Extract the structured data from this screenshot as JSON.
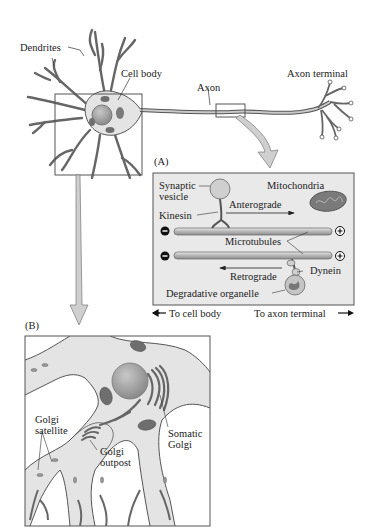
{
  "overview": {
    "labels": {
      "dendrites": "Dendrites",
      "cell_body": "Cell body",
      "axon": "Axon",
      "axon_terminal": "Axon terminal"
    }
  },
  "panel_a": {
    "letter": "(A)",
    "labels": {
      "synaptic_vesicle_line1": "Synaptic",
      "synaptic_vesicle_line2": "vesicle",
      "mitochondria": "Mitochondria",
      "kinesin": "Kinesin",
      "anterograde": "Anterograde",
      "microtubules": "Microtubules",
      "dynein": "Dynein",
      "retrograde": "Retrograde",
      "degradative_organelle": "Degradative organelle",
      "minus_symbol": "−",
      "plus_symbol": "+"
    },
    "direction": {
      "to_cell_body": "To cell body",
      "to_axon_terminal": "To axon terminal"
    }
  },
  "panel_b": {
    "letter": "(B)",
    "labels": {
      "golgi_satellite_line1": "Golgi",
      "golgi_satellite_line2": "satellite",
      "golgi_outpost_line1": "Golgi",
      "golgi_outpost_line2": "outpost",
      "somatic_golgi_line1": "Somatic",
      "somatic_golgi_line2": "Golgi"
    }
  },
  "colors": {
    "cell_fill": "#e4e4e4",
    "cell_stroke": "#555555",
    "nucleus": "#a8a8a8",
    "mitochondria": "#6e6e6e",
    "panel_bg": "#e9e9e9",
    "arrow_fill": "#cfcfcf"
  }
}
